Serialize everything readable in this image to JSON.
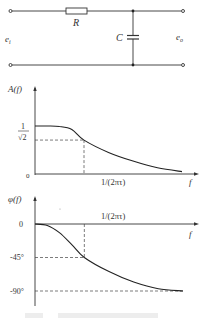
{
  "circuit": {
    "resistor_label": "R",
    "capacitor_label": "C",
    "input_label": "e",
    "input_sub": "i",
    "output_label": "e",
    "output_sub": "o"
  },
  "chart_data": [
    {
      "type": "line",
      "title": "",
      "ylabel": "A(f)",
      "xlabel": "f",
      "origin_label": "0",
      "x_marker_label": "1/(2πτ)",
      "y_marker_label_num": "1",
      "y_marker_label_den": "√2",
      "y_marker_value": 0.707,
      "x_marker_value": 1,
      "ylim": [
        0,
        1.3
      ],
      "series": [
        {
          "name": "amplitude",
          "x": [
            0,
            0.25,
            0.5,
            0.75,
            1,
            1.5,
            2,
            2.5,
            3
          ],
          "y": [
            1.0,
            1.0,
            0.99,
            0.93,
            0.707,
            0.45,
            0.27,
            0.13,
            0.05
          ]
        }
      ],
      "guides": [
        "dashed horizontal at 1/√2",
        "dashed vertical at 1/(2πτ)"
      ]
    },
    {
      "type": "line",
      "title": "",
      "ylabel": "φ(f)",
      "xlabel": "f",
      "x_marker_label": "1/(2πτ)",
      "y_ticks": [
        "0",
        "-45°",
        "-90°"
      ],
      "y_tick_values": [
        0,
        -45,
        -90
      ],
      "ylim": [
        -100,
        20
      ],
      "series": [
        {
          "name": "phase",
          "x": [
            0,
            0.25,
            0.5,
            0.75,
            1,
            1.5,
            2,
            2.5,
            3
          ],
          "y": [
            0,
            -2,
            -12,
            -28,
            -45,
            -64,
            -78,
            -87,
            -90
          ]
        }
      ],
      "guides": [
        "dashed horizontal at -45°",
        "dashed horizontal at -90°",
        "dashed vertical at 1/(2πτ)"
      ]
    }
  ]
}
